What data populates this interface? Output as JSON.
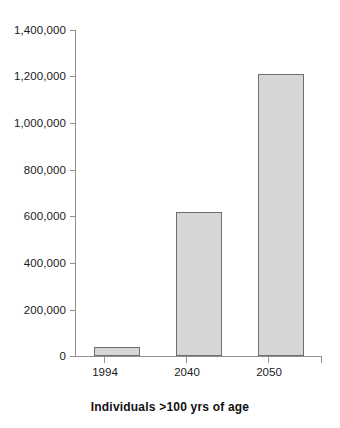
{
  "chart_data": {
    "type": "bar",
    "title": "",
    "xlabel": "Individuals >100 yrs of age",
    "ylabel": "",
    "categories": [
      "1994",
      "2040",
      "2050"
    ],
    "values": [
      40000,
      620000,
      1210000
    ],
    "series": [
      {
        "name": "Individuals over 100 years of age",
        "values": [
          40000,
          620000,
          1210000
        ]
      }
    ],
    "ylim": [
      0,
      1400000
    ],
    "ytick_values": [
      0,
      200000,
      400000,
      600000,
      800000,
      1000000,
      1200000,
      1400000
    ],
    "ytick_labels": [
      "0",
      "200,000",
      "400,000",
      "600,000",
      "800,000",
      "1,000,000",
      "1,200,000",
      "1,400,000"
    ],
    "grid": false,
    "legend": null,
    "legend_position": "none",
    "bar_fill_color": "#d6d6d6",
    "bar_border_color": "#6e6e6e",
    "axis_color": "#8f8f8f",
    "text_color": "#1a1a1a",
    "background_color": "#ffffff"
  },
  "axis_title": "Individuals >100 yrs of age"
}
